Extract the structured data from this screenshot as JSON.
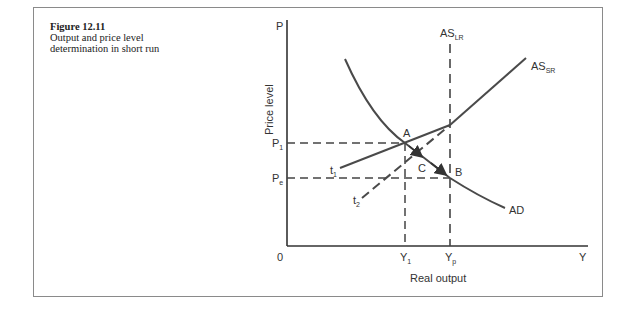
{
  "caption": {
    "figure_number": "Figure 12.11",
    "line1": "Output and price level",
    "line2": "determination in short run"
  },
  "axes": {
    "y_axis_label": "P",
    "y_axis_title": "Price level",
    "x_axis_label": "Y",
    "x_axis_title": "Real output",
    "origin_label": "0"
  },
  "levels": {
    "p1": {
      "main": "P",
      "sub": "1"
    },
    "pe": {
      "main": "P",
      "sub": "e"
    },
    "y1": {
      "main": "Y",
      "sub": "1"
    },
    "yp": {
      "main": "Y",
      "sub": "p"
    }
  },
  "curves": {
    "as_lr": {
      "main": "AS",
      "sub": "LR"
    },
    "as_sr": {
      "main": "AS",
      "sub": "SR"
    },
    "ad": "AD",
    "t1": {
      "main": "t",
      "sub": "1"
    },
    "t2": {
      "main": "t",
      "sub": "2"
    }
  },
  "points": {
    "a": "A",
    "b": "B",
    "c": "C"
  },
  "colors": {
    "line": "#4a4a4a",
    "frame": "#8a8a8a"
  }
}
